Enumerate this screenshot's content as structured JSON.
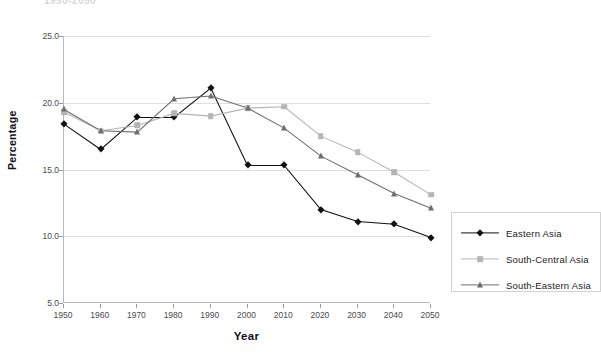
{
  "title": "1950-2050",
  "axes": {
    "ylabel": "Percentage",
    "xlabel": "Year",
    "yticks": [
      "5.0",
      "10.0",
      "15.0",
      "20.0",
      "25.0"
    ],
    "xticks": [
      "1950",
      "1960",
      "1970",
      "1980",
      "1990",
      "2000",
      "2010",
      "2020",
      "2030",
      "2040",
      "2050"
    ]
  },
  "legend": {
    "items": [
      {
        "label": "Eastern Asia",
        "color": "#111111",
        "marker": "diamond"
      },
      {
        "label": "South-Central Asia",
        "color": "#b5b5b5",
        "marker": "square"
      },
      {
        "label": "South-Eastern Asia",
        "color": "#6e6e6e",
        "marker": "triangle"
      }
    ]
  },
  "chart_data": {
    "type": "line",
    "title": "1950-2050",
    "xlabel": "Year",
    "ylabel": "Percentage",
    "ylim": [
      5.0,
      25.0
    ],
    "xlim": [
      1950,
      2050
    ],
    "grid": true,
    "legend_position": "right",
    "x": [
      1950,
      1960,
      1970,
      1980,
      1990,
      2000,
      2010,
      2020,
      2030,
      2040,
      2050
    ],
    "series": [
      {
        "name": "Eastern Asia",
        "color": "#111111",
        "marker": "diamond",
        "values": [
          18.4,
          16.5,
          18.9,
          18.9,
          21.1,
          15.3,
          15.3,
          12.0,
          11.1,
          10.9,
          9.9
        ]
      },
      {
        "name": "South-Central Asia",
        "color": "#b5b5b5",
        "marker": "square",
        "values": [
          19.3,
          17.9,
          18.3,
          19.2,
          19.0,
          19.6,
          19.7,
          17.5,
          16.3,
          14.8,
          13.1
        ]
      },
      {
        "name": "South-Eastern Asia",
        "color": "#6e6e6e",
        "marker": "triangle",
        "values": [
          19.5,
          17.9,
          17.8,
          20.3,
          20.5,
          19.6,
          18.1,
          16.0,
          14.6,
          13.2,
          12.1
        ]
      }
    ]
  }
}
